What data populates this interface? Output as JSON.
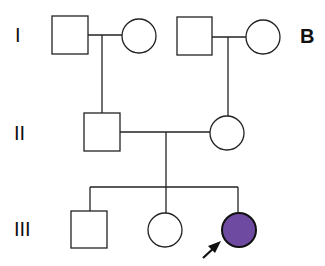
{
  "panel_label": "B",
  "generations": [
    "I",
    "II",
    "III"
  ],
  "colors": {
    "affected": "#6f4aa1",
    "line": "#222222",
    "unaffected": "#ffffff"
  },
  "individuals": [
    {
      "id": "I-1",
      "sex": "male",
      "affected": false
    },
    {
      "id": "I-2",
      "sex": "female",
      "affected": false
    },
    {
      "id": "I-3",
      "sex": "male",
      "affected": false
    },
    {
      "id": "I-4",
      "sex": "female",
      "affected": false
    },
    {
      "id": "II-1",
      "sex": "male",
      "affected": false
    },
    {
      "id": "II-2",
      "sex": "female",
      "affected": false
    },
    {
      "id": "III-1",
      "sex": "male",
      "affected": false
    },
    {
      "id": "III-2",
      "sex": "female",
      "affected": false
    },
    {
      "id": "III-3",
      "sex": "female",
      "affected": true,
      "proband": true
    }
  ]
}
